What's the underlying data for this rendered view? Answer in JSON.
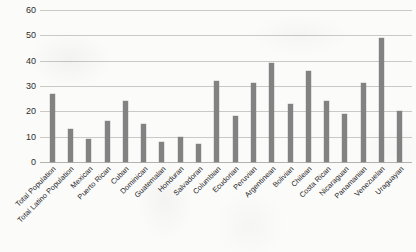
{
  "chart_data": {
    "type": "bar",
    "title": "",
    "subtitle": "",
    "xlabel": "",
    "ylabel": "",
    "ylim": [
      0,
      60
    ],
    "ytick_step": 10,
    "yticks": [
      0,
      10,
      20,
      30,
      40,
      50,
      60
    ],
    "grid": true,
    "legend": "none",
    "bar_color": "#828282",
    "background_color": "#fbfbfa",
    "gridline_color": "#c9c9c7",
    "categories": [
      "Total Population",
      "Total Latino Population",
      "Mexican",
      "Puerto Rican",
      "Cuban",
      "Dominican",
      "Guatemalan",
      "Honduran",
      "Salvadoran",
      "Columbian",
      "Ecudorian",
      "Peruvian",
      "Argentinean",
      "Bolivian",
      "Chilean",
      "Costa Rican",
      "Nicaraguan",
      "Panamanian",
      "Venezuelan",
      "Uraguayan"
    ],
    "values": [
      27,
      13,
      9,
      16,
      24,
      15,
      8,
      10,
      7,
      32,
      18,
      31,
      39,
      23,
      36,
      24,
      19,
      31,
      49,
      20
    ]
  }
}
